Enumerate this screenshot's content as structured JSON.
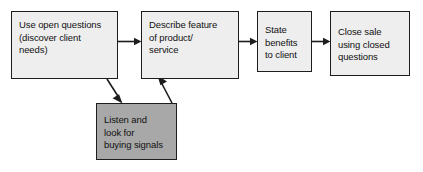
{
  "diagram": {
    "background_color": "#ffffff",
    "node_fill": "#eeeeee",
    "node_shaded_fill": "#a8a8a8",
    "node_border_color": "#1d1d1d",
    "nodes": [
      {
        "id": "open-questions",
        "label": "Use open questions\n(discover client\nneeds)",
        "style": "light"
      },
      {
        "id": "describe-feature",
        "label": "Describe feature\nof product/\nservice",
        "style": "light"
      },
      {
        "id": "state-benefits",
        "label": "State\nbenefits\nto client",
        "style": "light"
      },
      {
        "id": "close-sale",
        "label": "Close sale\nusing closed\nquestions",
        "style": "light"
      },
      {
        "id": "buying-signals",
        "label": "Listen and\nlook for\nbuying signals",
        "style": "shaded"
      }
    ],
    "edges": [
      {
        "id": "e1",
        "from": "open-questions",
        "to": "describe-feature",
        "kind": "horizontal-arrow"
      },
      {
        "id": "e2",
        "from": "describe-feature",
        "to": "state-benefits",
        "kind": "horizontal-arrow"
      },
      {
        "id": "e3",
        "from": "state-benefits",
        "to": "close-sale",
        "kind": "horizontal-arrow"
      },
      {
        "id": "e4",
        "from": "open-questions",
        "to": "buying-signals",
        "kind": "diagonal-arrow-down"
      },
      {
        "id": "e5",
        "from": "buying-signals",
        "to": "describe-feature",
        "kind": "diagonal-arrow-up"
      }
    ]
  }
}
